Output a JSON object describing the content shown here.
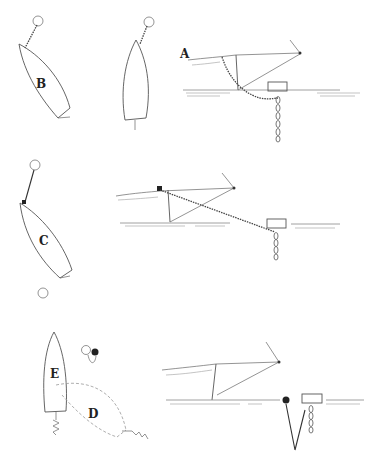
{
  "diagram": {
    "colors": {
      "line": "#555555",
      "background": "#ffffff",
      "label": "#222222"
    },
    "panels": [
      {
        "id": "row1-left",
        "label": "B",
        "description": "Boat hull seen from above, bow tethered to a mooring buoy"
      },
      {
        "id": "row1-mid",
        "label": "",
        "description": "Boat hull seen from above, tethered to buoy, straight alignment"
      },
      {
        "id": "row1-right",
        "label": "A",
        "description": "Side view: bow chain running to a mooring block/float with chain hanging below"
      },
      {
        "id": "row2-left",
        "label": "C",
        "description": "Boat hull seen from above, bow line to buoy, second buoy astern"
      },
      {
        "id": "row2-right",
        "label": "",
        "description": "Side view: taut line from bow to mooring float, chain hanging below"
      },
      {
        "id": "row3-left-E",
        "label": "E",
        "description": "Boat hull seen from above with stern anchor line, buoy pair forward"
      },
      {
        "id": "row3-left-D",
        "label": "D",
        "description": "Dashed swing arc showing boat movement area toward anchor"
      },
      {
        "id": "row3-right",
        "label": "",
        "description": "Side view: bow to dark pickup buoy, V-shaped rode to mooring float with chain"
      }
    ]
  }
}
